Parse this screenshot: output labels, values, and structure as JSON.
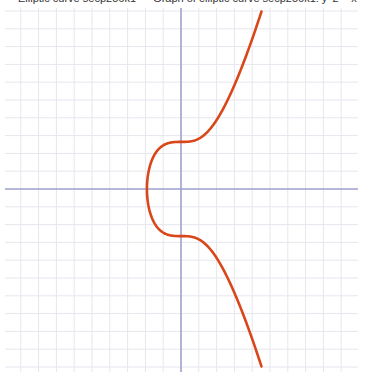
{
  "caption": "Elliptic curve secp256k1 — Graph of elliptic curve secp256k1: y^2 = x^3 + 7",
  "chart_data": {
    "type": "line",
    "title": "Elliptic curve secp256k1: y^2 = x^3 + 7",
    "xlabel": "",
    "ylabel": "",
    "equation": "y^2 = x^3 + 7",
    "grid": true,
    "legend": null,
    "xlim": [
      -10,
      10
    ],
    "ylim": [
      -10.3,
      10.3
    ],
    "grid_step": 1,
    "series": [
      {
        "name": "y^2 = x^3 + 7",
        "color": "#d9461a",
        "points_upper": [
          [
            -1.913,
            0
          ],
          [
            -1.8,
            1.15
          ],
          [
            -1.5,
            1.92
          ],
          [
            -1.0,
            2.45
          ],
          [
            -0.5,
            2.62
          ],
          [
            0,
            2.646
          ],
          [
            0.5,
            2.67
          ],
          [
            1.0,
            2.83
          ],
          [
            1.5,
            3.25
          ],
          [
            2.0,
            3.87
          ],
          [
            2.5,
            4.79
          ],
          [
            3.0,
            5.83
          ],
          [
            3.5,
            7.05
          ],
          [
            4.0,
            8.43
          ],
          [
            4.5,
            9.9
          ]
        ],
        "points_lower": [
          [
            -1.913,
            0
          ],
          [
            -1.8,
            -1.15
          ],
          [
            -1.5,
            -1.92
          ],
          [
            -1.0,
            -2.45
          ],
          [
            -0.5,
            -2.62
          ],
          [
            0,
            -2.646
          ],
          [
            0.5,
            -2.67
          ],
          [
            1.0,
            -2.83
          ],
          [
            1.5,
            -3.25
          ],
          [
            2.0,
            -3.87
          ],
          [
            2.5,
            -4.79
          ],
          [
            3.0,
            -5.83
          ],
          [
            3.5,
            -7.05
          ],
          [
            4.0,
            -8.43
          ],
          [
            4.5,
            -9.9
          ]
        ]
      }
    ],
    "axis_color": "#9ea0cc",
    "grid_color": "#e6e6ee"
  }
}
